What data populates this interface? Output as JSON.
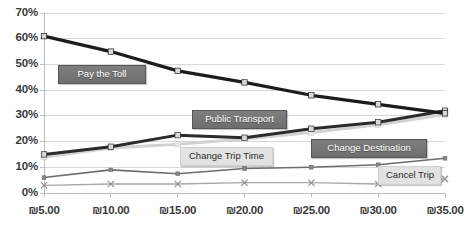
{
  "chart_data": {
    "type": "line",
    "title": "",
    "subtitle": "",
    "xlabel": "",
    "ylabel": "",
    "grid": true,
    "legend_position": "inline-data-labels",
    "x": [
      5,
      10,
      15,
      20,
      25,
      30,
      35
    ],
    "categories": [
      "₪5.00",
      "₪10.00",
      "₪15.00",
      "₪20.00",
      "₪25.00",
      "₪30.00",
      "₪35.00"
    ],
    "ylim": [
      0,
      70
    ],
    "ytick_values": [
      0,
      10,
      20,
      30,
      40,
      50,
      60,
      70
    ],
    "ytick_labels": [
      "0%",
      "10%",
      "20%",
      "30%",
      "40%",
      "50%",
      "60%",
      "70%"
    ],
    "series": [
      {
        "name": "Pay the Toll",
        "values": [
          61,
          55,
          47.5,
          43,
          38,
          34.5,
          31
        ],
        "color": "#1c1c1c",
        "width": 3.2,
        "marker": "square",
        "marker_fill": "#d9d9d9"
      },
      {
        "name": "Public Transport",
        "values": [
          15,
          18,
          22.5,
          21.5,
          25,
          27.5,
          32
        ],
        "color": "#2b2b2b",
        "width": 3.0,
        "marker": "square",
        "marker_fill": "#d9d9d9"
      },
      {
        "name": "Change Trip Time",
        "values": [
          14,
          17.5,
          19,
          21,
          23.5,
          26.5,
          30.5
        ],
        "color": "#d2d2d2",
        "width": 3.0,
        "marker": "square",
        "marker_fill": "#e8e8e8"
      },
      {
        "name": "Change Destination",
        "values": [
          6,
          9,
          7.5,
          9.5,
          10,
          11,
          13.5
        ],
        "color": "#6d6d6d",
        "width": 1.6,
        "marker": "square",
        "marker_fill": "#8a8a8a"
      },
      {
        "name": "Cancel Trip",
        "values": [
          3,
          3.5,
          3.5,
          4,
          4,
          3.5,
          5.5
        ],
        "color": "#a8a8a8",
        "width": 1.3,
        "marker": "x",
        "marker_fill": "#8f8f8f"
      }
    ],
    "data_labels": [
      {
        "text": "Pay the Toll",
        "style": "dark",
        "x": 58,
        "y": 65,
        "w": 88
      },
      {
        "text": "Public Transport",
        "style": "dark",
        "x": 192,
        "y": 110,
        "w": 95
      },
      {
        "text": "Change Destination",
        "style": "dark",
        "x": 311,
        "y": 139,
        "w": 116
      },
      {
        "text": "Change Trip Time",
        "style": "pale",
        "x": 180,
        "y": 147,
        "w": 93
      },
      {
        "text": "Cancel Trip",
        "style": "pale",
        "x": 378,
        "y": 166,
        "w": 63
      }
    ]
  },
  "axis": {
    "plot_left": 44,
    "plot_right": 445,
    "plot_top": 13,
    "plot_bottom": 193
  },
  "colors": {
    "grid": "#d8d8d8",
    "axis": "#bdbdbd",
    "text": "#3a3a3a",
    "background": "#ffffff"
  }
}
